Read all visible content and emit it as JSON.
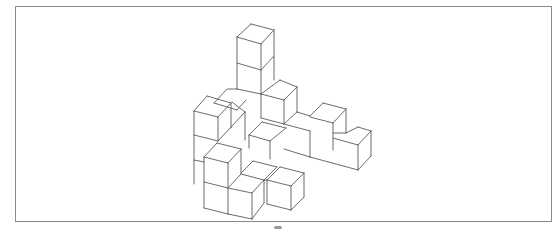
{
  "figure": {
    "frame": {
      "x": 15,
      "y": 6,
      "width": 537,
      "height": 216,
      "color": "#8a8a8a"
    },
    "line_color": "#5a5a5a",
    "segments": [
      [
        237,
        37,
        251,
        24
      ],
      [
        251,
        24,
        274,
        30
      ],
      [
        274,
        30,
        261,
        44
      ],
      [
        261,
        44,
        237,
        37
      ],
      [
        237,
        37,
        237,
        89
      ],
      [
        261,
        44,
        261,
        94
      ],
      [
        274,
        30,
        274,
        80
      ],
      [
        237,
        63,
        261,
        70
      ],
      [
        261,
        70,
        274,
        56
      ],
      [
        237,
        89,
        261,
        94
      ],
      [
        228,
        89,
        237,
        89
      ],
      [
        227,
        89,
        214,
        103
      ],
      [
        214,
        103,
        237,
        110
      ],
      [
        237,
        110,
        246,
        100
      ],
      [
        261,
        94,
        280,
        80
      ],
      [
        280,
        80,
        297,
        87
      ],
      [
        297,
        87,
        284,
        100
      ],
      [
        284,
        100,
        261,
        94
      ],
      [
        284,
        100,
        284,
        124
      ],
      [
        297,
        87,
        297,
        112
      ],
      [
        297,
        112,
        284,
        124
      ],
      [
        261,
        94,
        261,
        118
      ],
      [
        261,
        118,
        284,
        124
      ],
      [
        194,
        111,
        207,
        96
      ],
      [
        207,
        96,
        231,
        103
      ],
      [
        231,
        103,
        218,
        117
      ],
      [
        218,
        117,
        194,
        111
      ],
      [
        194,
        111,
        194,
        184
      ],
      [
        218,
        117,
        218,
        141
      ],
      [
        231,
        103,
        231,
        128
      ],
      [
        194,
        135,
        218,
        141
      ],
      [
        194,
        160,
        204,
        162
      ],
      [
        232,
        102,
        245,
        112
      ],
      [
        218,
        141,
        245,
        112
      ],
      [
        245,
        112,
        245,
        140
      ],
      [
        284,
        124,
        310,
        131
      ],
      [
        310,
        131,
        310,
        157
      ],
      [
        297,
        112,
        310,
        116
      ],
      [
        310,
        116,
        323,
        103
      ],
      [
        323,
        103,
        346,
        109
      ],
      [
        346,
        109,
        333,
        123
      ],
      [
        333,
        123,
        310,
        117
      ],
      [
        333,
        123,
        333,
        150
      ],
      [
        346,
        109,
        346,
        133
      ],
      [
        333,
        133,
        346,
        133
      ],
      [
        346,
        133,
        358,
        127
      ],
      [
        358,
        127,
        371,
        131
      ],
      [
        371,
        131,
        358,
        145
      ],
      [
        358,
        145,
        333,
        138
      ],
      [
        358,
        145,
        358,
        170
      ],
      [
        371,
        131,
        371,
        156
      ],
      [
        371,
        156,
        358,
        170
      ],
      [
        284,
        149,
        310,
        157
      ],
      [
        310,
        157,
        358,
        170
      ],
      [
        249,
        135,
        262,
        122
      ],
      [
        262,
        122,
        286,
        128
      ],
      [
        286,
        128,
        270,
        141
      ],
      [
        270,
        141,
        249,
        135
      ],
      [
        270,
        141,
        270,
        159
      ],
      [
        249,
        135,
        249,
        148
      ],
      [
        204,
        157,
        217,
        143
      ],
      [
        217,
        143,
        241,
        149
      ],
      [
        241,
        149,
        228,
        163
      ],
      [
        228,
        163,
        204,
        157
      ],
      [
        204,
        157,
        204,
        208
      ],
      [
        228,
        163,
        228,
        214
      ],
      [
        241,
        149,
        241,
        173
      ],
      [
        204,
        182,
        228,
        188
      ],
      [
        228,
        188,
        241,
        174
      ],
      [
        241,
        174,
        264,
        180
      ],
      [
        264,
        180,
        252,
        193
      ],
      [
        252,
        193,
        228,
        188
      ],
      [
        252,
        193,
        252,
        219
      ],
      [
        264,
        180,
        264,
        203
      ],
      [
        264,
        203,
        252,
        219
      ],
      [
        204,
        208,
        228,
        214
      ],
      [
        228,
        214,
        252,
        219
      ],
      [
        241,
        173,
        253,
        161
      ],
      [
        253,
        161,
        277,
        167
      ],
      [
        277,
        167,
        264,
        180
      ],
      [
        264,
        180,
        267,
        180
      ],
      [
        267,
        180,
        280,
        167
      ],
      [
        280,
        167,
        304,
        173
      ],
      [
        304,
        173,
        291,
        186
      ],
      [
        291,
        186,
        267,
        180
      ],
      [
        267,
        180,
        267,
        204
      ],
      [
        291,
        186,
        291,
        210
      ],
      [
        304,
        173,
        304,
        197
      ],
      [
        304,
        197,
        291,
        210
      ],
      [
        267,
        204,
        291,
        210
      ]
    ]
  }
}
